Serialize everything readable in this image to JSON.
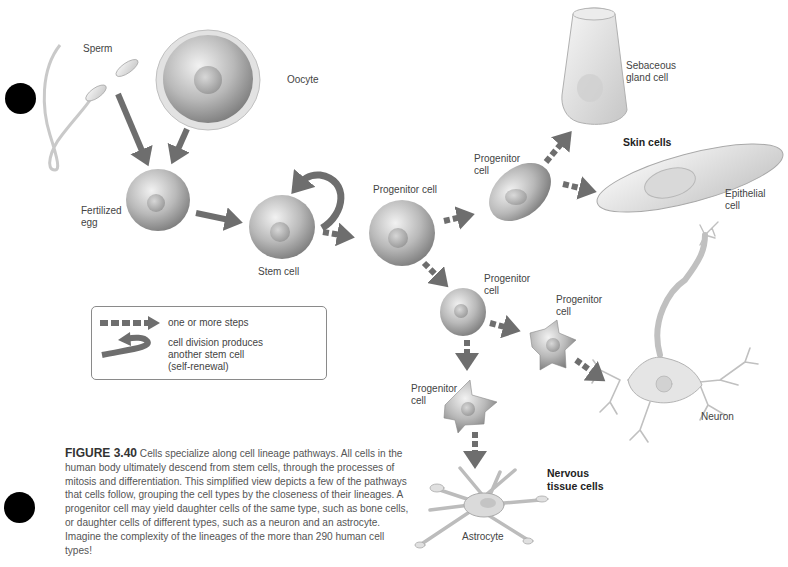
{
  "figure": {
    "number": "FIGURE 3.40",
    "caption": "Cells specialize along cell lineage pathways. All cells in the human body ultimately descend from stem cells, through the processes of mitosis and differentiation. This simplified view depicts a few of the pathways that cells follow, grouping the cell types by the closeness of their lineages. A progenitor cell may yield daughter cells of the same type, such as bone cells, or daughter cells of different types, such as a neuron and an astrocyte. Imagine the complexity of the lineages of the more than 290 human cell types!"
  },
  "labels": {
    "sperm": "Sperm",
    "oocyte": "Oocyte",
    "fertilized_egg": "Fertilized\negg",
    "stem_cell": "Stem cell",
    "progenitor_main": "Progenitor cell",
    "progenitor_skin": "Progenitor\ncell",
    "sebaceous": "Sebaceous\ngland cell",
    "skin_cells": "Skin cells",
    "epithelial": "Epithelial\ncell",
    "progenitor_nerve": "Progenitor\ncell",
    "progenitor_neuron": "Progenitor\ncell",
    "progenitor_astro": "Progenitor\ncell",
    "neuron": "Neuron",
    "nervous_tissue": "Nervous\ntissue cells",
    "astrocyte": "Astrocyte"
  },
  "legend": {
    "dashed_arrow": "one or more steps",
    "curved_arrow": "cell division produces\nanother stem cell\n(self-renewal)"
  },
  "colors": {
    "arrow": "#6e6e6e",
    "cell_fill": "#b8b8b8",
    "background": "#ffffff"
  }
}
